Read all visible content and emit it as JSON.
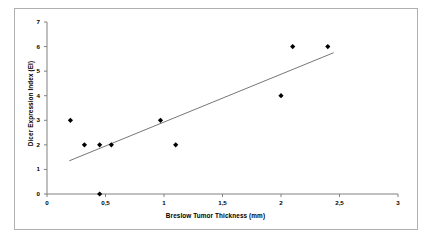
{
  "chart_data": {
    "type": "scatter",
    "title": "",
    "xlabel": "Breslow Tumor Thickness (mm)",
    "ylabel": "Dicer Expression Index (EI)",
    "xlim": [
      0,
      3
    ],
    "ylim": [
      0,
      7
    ],
    "xticks": [
      "0",
      "0,5",
      "1",
      "1,5",
      "2",
      "2,5",
      "3"
    ],
    "xtick_values": [
      0,
      0.5,
      1,
      1.5,
      2,
      2.5,
      3
    ],
    "yticks": [
      "0",
      "1",
      "2",
      "3",
      "4",
      "5",
      "6",
      "7"
    ],
    "ytick_values": [
      0,
      1,
      2,
      3,
      4,
      5,
      6,
      7
    ],
    "grid": false,
    "legend": false,
    "marker": "diamond",
    "marker_color": "#000000",
    "series": [
      {
        "name": "Dicer Expression Index vs Breslow Thickness",
        "points": [
          {
            "x": 0.2,
            "y": 3
          },
          {
            "x": 0.32,
            "y": 2
          },
          {
            "x": 0.45,
            "y": 2
          },
          {
            "x": 0.45,
            "y": 0
          },
          {
            "x": 0.55,
            "y": 2
          },
          {
            "x": 0.97,
            "y": 3
          },
          {
            "x": 1.1,
            "y": 2
          },
          {
            "x": 2.0,
            "y": 4
          },
          {
            "x": 2.1,
            "y": 6
          },
          {
            "x": 2.4,
            "y": 6
          }
        ]
      }
    ],
    "trendline": {
      "type": "linear",
      "color": "#666666",
      "x_start": 0.19,
      "y_start": 1.35,
      "x_end": 2.45,
      "y_end": 5.75
    },
    "axis_color": "#808080",
    "plot_background": "#ffffff"
  }
}
